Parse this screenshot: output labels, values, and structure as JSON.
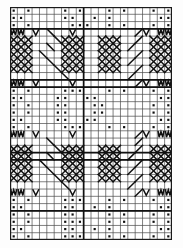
{
  "chart_data": {
    "type": "heatmap",
    "title": "",
    "xlabel": "",
    "ylabel": "",
    "grid": true,
    "legend": "none",
    "columns": 22,
    "rows": 32,
    "cell_px": 7.35,
    "symbol_legend": [
      {
        "key": "dot",
        "name": "dot-symbol",
        "glyph": "■",
        "meaning": "filled square dot"
      },
      {
        "key": "v",
        "name": "v-stitch-symbol",
        "glyph": "V",
        "meaning": "v zigzag down"
      },
      {
        "key": "w",
        "name": "w-stitch-symbol",
        "glyph": "W",
        "meaning": "w double zigzag"
      },
      {
        "key": "x",
        "name": "cross-lattice-symbol",
        "glyph": "✕",
        "meaning": "crossed lattice diamond"
      },
      {
        "key": "b",
        "name": "diagonal-rise-symbol",
        "glyph": "╱",
        "meaning": "diagonal rising line"
      },
      {
        "key": "d",
        "name": "diagonal-fall-symbol",
        "glyph": "╲",
        "meaning": "diagonal falling line"
      },
      {
        "key": "",
        "name": "blank-cell",
        "glyph": "",
        "meaning": "empty"
      }
    ],
    "major_row_lines": [
      3,
      10,
      11,
      20,
      21,
      28
    ],
    "major_col_lines": [
      0,
      10,
      22
    ],
    "cells": [
      [
        "dot",
        "",
        "dot",
        "",
        "",
        "",
        "",
        "dot",
        "",
        "dot",
        "",
        "",
        "",
        "dot",
        "",
        "dot",
        "",
        "",
        "",
        "dot",
        "",
        "dot"
      ],
      [
        "dot",
        "dot",
        "",
        "",
        "",
        "",
        "",
        "dot",
        "dot",
        "",
        "",
        "dot",
        "",
        "dot",
        "",
        "",
        "",
        "",
        "",
        "",
        "dot",
        "dot"
      ],
      [
        "dot",
        "",
        "dot",
        "",
        "",
        "",
        "",
        "",
        "dot",
        "dot",
        "dot",
        "",
        "",
        "dot",
        "",
        "dot",
        "",
        "",
        "",
        "dot",
        "",
        "dot"
      ],
      [
        "w",
        "w",
        "",
        "v",
        "",
        "d",
        "",
        "",
        "v",
        "",
        "",
        "",
        "",
        "",
        "",
        "",
        "",
        "b",
        "v",
        "",
        "w",
        "w"
      ],
      [
        "x",
        "x",
        "x",
        "",
        "",
        "",
        "d",
        "x",
        "x",
        "x",
        "",
        "",
        "x",
        "x",
        "x",
        "",
        "",
        "b",
        "",
        "x",
        "x",
        "x"
      ],
      [
        "x",
        "x",
        "x",
        "",
        "",
        "d",
        "",
        "x",
        "x",
        "x",
        "",
        "",
        "x",
        "x",
        "x",
        "",
        "b",
        "",
        "",
        "x",
        "x",
        "x"
      ],
      [
        "x",
        "x",
        "x",
        "",
        "d",
        "",
        "",
        "x",
        "x",
        "x",
        "",
        "",
        "x",
        "x",
        "x",
        "",
        "",
        "b",
        "",
        "x",
        "x",
        "x"
      ],
      [
        "x",
        "x",
        "x",
        "",
        "",
        "d",
        "",
        "x",
        "x",
        "x",
        "",
        "",
        "x",
        "x",
        "x",
        "",
        "b",
        "",
        "",
        "x",
        "x",
        "x"
      ],
      [
        "x",
        "x",
        "x",
        "",
        "",
        "",
        "d",
        "x",
        "x",
        "x",
        "",
        "",
        "x",
        "x",
        "x",
        "",
        "",
        "b",
        "",
        "x",
        "x",
        "x"
      ],
      [
        "",
        "",
        "",
        "",
        "",
        "",
        "",
        "d",
        "",
        "",
        "",
        "",
        "",
        "",
        "",
        "",
        "b",
        "",
        "",
        "",
        "",
        ""
      ],
      [
        "w",
        "w",
        "",
        "v",
        "",
        "",
        "",
        "",
        "v",
        "",
        "",
        "",
        "",
        "",
        "",
        "",
        "",
        "b",
        "v",
        "",
        "w",
        "w"
      ],
      [
        "dot",
        "",
        "dot",
        "",
        "",
        "",
        "",
        "dot",
        "dot",
        "dot",
        "",
        "",
        "",
        "dot",
        "",
        "dot",
        "",
        "",
        "",
        "dot",
        "",
        "dot"
      ],
      [
        "dot",
        "dot",
        "",
        "",
        "",
        "",
        "dot",
        "dot",
        "",
        "",
        "dot",
        "dot",
        "",
        "",
        "",
        "",
        "",
        "",
        "",
        "",
        "dot",
        "dot"
      ],
      [
        "dot",
        "",
        "dot",
        "",
        "",
        "",
        "dot",
        "dot",
        "",
        "",
        "",
        "dot",
        "dot",
        "",
        "",
        "",
        "",
        "",
        "",
        "dot",
        "",
        "dot"
      ],
      [
        "dot",
        "",
        "dot",
        "",
        "",
        "",
        "dot",
        "dot",
        "",
        "",
        "",
        "dot",
        "dot",
        "",
        "",
        "",
        "",
        "",
        "",
        "dot",
        "",
        "dot"
      ],
      [
        "dot",
        "dot",
        "",
        "",
        "",
        "",
        "dot",
        "dot",
        "",
        "",
        "dot",
        "dot",
        "",
        "",
        "",
        "",
        "",
        "",
        "",
        "",
        "dot",
        "dot"
      ],
      [
        "dot",
        "",
        "dot",
        "",
        "",
        "",
        "",
        "dot",
        "dot",
        "dot",
        "",
        "",
        "",
        "dot",
        "",
        "dot",
        "",
        "",
        "",
        "dot",
        "",
        "dot"
      ],
      [
        "w",
        "w",
        "",
        "v",
        "",
        "",
        "",
        "",
        "v",
        "",
        "",
        "",
        "",
        "",
        "",
        "",
        "",
        "b",
        "v",
        "",
        "w",
        "w"
      ],
      [
        "",
        "",
        "",
        "",
        "",
        "d",
        "",
        "",
        "",
        "",
        "",
        "",
        "",
        "",
        "",
        "",
        "",
        "b",
        "",
        "",
        "",
        ""
      ],
      [
        "x",
        "x",
        "x",
        "",
        "",
        "",
        "d",
        "x",
        "x",
        "x",
        "",
        "",
        "x",
        "x",
        "x",
        "",
        "",
        "b",
        "",
        "x",
        "x",
        "x"
      ],
      [
        "x",
        "x",
        "x",
        "",
        "",
        "d",
        "",
        "x",
        "x",
        "x",
        "",
        "",
        "x",
        "x",
        "x",
        "",
        "b",
        "",
        "",
        "x",
        "x",
        "x"
      ],
      [
        "x",
        "x",
        "x",
        "",
        "d",
        "",
        "",
        "x",
        "x",
        "x",
        "",
        "",
        "x",
        "x",
        "x",
        "",
        "",
        "b",
        "",
        "x",
        "x",
        "x"
      ],
      [
        "x",
        "x",
        "x",
        "",
        "",
        "d",
        "",
        "x",
        "x",
        "x",
        "",
        "",
        "x",
        "x",
        "x",
        "",
        "b",
        "",
        "",
        "x",
        "x",
        "x"
      ],
      [
        "x",
        "x",
        "x",
        "",
        "",
        "",
        "d",
        "x",
        "x",
        "x",
        "",
        "",
        "x",
        "x",
        "x",
        "",
        "",
        "b",
        "",
        "x",
        "x",
        "x"
      ],
      [
        "",
        "",
        "",
        "",
        "",
        "",
        "",
        "d",
        "",
        "",
        "",
        "",
        "",
        "",
        "",
        "",
        "b",
        "",
        "",
        "",
        "",
        ""
      ],
      [
        "w",
        "w",
        "",
        "v",
        "",
        "",
        "",
        "",
        "v",
        "",
        "",
        "",
        "",
        "",
        "",
        "",
        "",
        "b",
        "v",
        "",
        "w",
        "w"
      ],
      [
        "dot",
        "",
        "dot",
        "",
        "",
        "",
        "",
        "dot",
        "dot",
        "dot",
        "",
        "",
        "",
        "dot",
        "",
        "dot",
        "",
        "",
        "",
        "dot",
        "",
        "dot"
      ],
      [
        "dot",
        "dot",
        "",
        "",
        "",
        "",
        "",
        "dot",
        "dot",
        "",
        "",
        "dot",
        "",
        "dot",
        "",
        "",
        "",
        "",
        "",
        "",
        "dot",
        "dot"
      ],
      [
        "dot",
        "",
        "dot",
        "",
        "",
        "",
        "",
        "dot",
        "dot",
        "",
        "",
        "",
        "",
        "dot",
        "",
        "dot",
        "",
        "",
        "",
        "dot",
        "",
        "dot"
      ],
      [
        "dot",
        "",
        "dot",
        "",
        "",
        "",
        "",
        "dot",
        "dot",
        "dot",
        "",
        "",
        "",
        "dot",
        "",
        "dot",
        "",
        "",
        "",
        "dot",
        "",
        "dot"
      ],
      [
        "dot",
        "dot",
        "",
        "",
        "",
        "",
        "",
        "dot",
        "dot",
        "",
        "",
        "dot",
        "",
        "dot",
        "",
        "",
        "",
        "",
        "",
        "",
        "dot",
        "dot"
      ],
      [
        "dot",
        "",
        "dot",
        "",
        "",
        "",
        "",
        "dot",
        "dot",
        "dot",
        "",
        "",
        "",
        "dot",
        "",
        "dot",
        "",
        "",
        "",
        "dot",
        "",
        "dot"
      ]
    ]
  },
  "colors": {
    "ink": "#111111",
    "gridline": "#4a4a4a",
    "gridline_major": "#111111",
    "background": "#ffffff",
    "page": "#fdfdfd"
  }
}
